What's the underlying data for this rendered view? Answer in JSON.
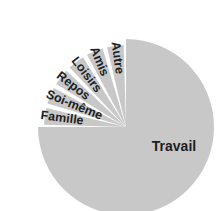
{
  "chart_data": {
    "type": "pie",
    "title": "",
    "labels": [
      "Travail",
      "Famille",
      "Soi-même",
      "Repos",
      "Loisirs",
      "Amis",
      "Autre"
    ],
    "values": [
      75,
      4.17,
      4.17,
      4.17,
      4.17,
      4.17,
      4.16
    ],
    "unit": "%",
    "start_angle_deg": 0,
    "direction": "clockwise",
    "legend": "none (labels placed on/next to slices)",
    "fill_color": "#c8c8c8",
    "gap_color": "#ffffff",
    "label_color": "#1e1e1e",
    "exploded_small_slices": true
  },
  "geometry": {
    "cx": 126,
    "cy": 127,
    "r_main": 88,
    "r_small": 82,
    "gap_deg": 3.2
  }
}
